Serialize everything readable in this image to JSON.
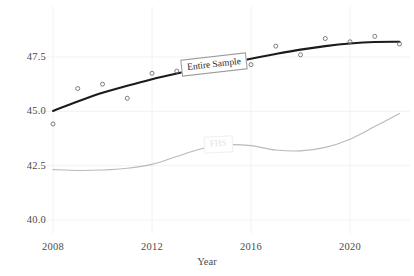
{
  "chart_data": {
    "type": "line",
    "title": "",
    "subtitle": "",
    "xlabel": "Year",
    "ylabel": "",
    "xlim": [
      2007.3,
      2022.3
    ],
    "ylim": [
      39.2,
      48.9
    ],
    "grid": true,
    "legend_position": "inline-annotations",
    "xticks": [
      2008,
      2012,
      2016,
      2020
    ],
    "xtick_labels": [
      "2008",
      "2012",
      "2016",
      "2020"
    ],
    "yticks": [
      40.0,
      42.5,
      45.0,
      47.5
    ],
    "ytick_labels": [
      "40.0",
      "42.5",
      "45.0",
      "47.5"
    ],
    "series": [
      {
        "name": "Entire Sample",
        "color": "#1b1b1b",
        "style": "smooth-fit-with-open-circle-markers",
        "x": [
          2008,
          2009,
          2010,
          2011,
          2012,
          2013,
          2014,
          2015,
          2016,
          2017,
          2018,
          2019,
          2020,
          2021,
          2022
        ],
        "values": [
          44.42,
          46.05,
          46.25,
          45.6,
          46.75,
          46.85,
          47.05,
          47.0,
          47.15,
          48.0,
          47.6,
          48.35,
          48.2,
          48.45,
          48.1
        ],
        "fit": [
          45.02,
          45.45,
          45.85,
          46.18,
          46.48,
          46.74,
          46.98,
          47.2,
          47.42,
          47.64,
          47.84,
          48.0,
          48.12,
          48.19,
          48.2
        ]
      },
      {
        "name": "FHS",
        "color": "#b9b9b9",
        "style": "smooth-fit-faint",
        "x": [
          2008,
          2009,
          2010,
          2011,
          2012,
          2013,
          2014,
          2015,
          2016,
          2017,
          2018,
          2019,
          2020,
          2021,
          2022
        ],
        "fit": [
          42.32,
          42.28,
          42.3,
          42.38,
          42.56,
          42.92,
          43.28,
          43.46,
          43.42,
          43.22,
          43.18,
          43.34,
          43.72,
          44.3,
          44.9
        ]
      }
    ],
    "annotations": [
      {
        "name": "Entire Sample",
        "x": 2013.4,
        "y": 47.1,
        "rotation_deg": -6.5,
        "boxed": true
      },
      {
        "name": "FHS",
        "x": 2014.6,
        "y": 43.5,
        "rotation_deg": -3,
        "boxed": true,
        "faint": true
      }
    ]
  },
  "axes": {
    "xlabel": "Year",
    "xticks": [
      {
        "label": "2008"
      },
      {
        "label": "2012"
      },
      {
        "label": "2016"
      },
      {
        "label": "2020"
      }
    ],
    "yticks": [
      {
        "label": "47.5"
      },
      {
        "label": "45.0"
      },
      {
        "label": "42.5"
      },
      {
        "label": "40.0"
      }
    ]
  },
  "annotations": {
    "entire_sample": "Entire Sample",
    "fhs": "FHS"
  },
  "colors": {
    "entire_sample_line": "#1b1b1b",
    "fhs_line": "#b9b9b9",
    "grid": "#f2f2f2",
    "text": "#4a4a4a",
    "background": "#ffffff"
  }
}
